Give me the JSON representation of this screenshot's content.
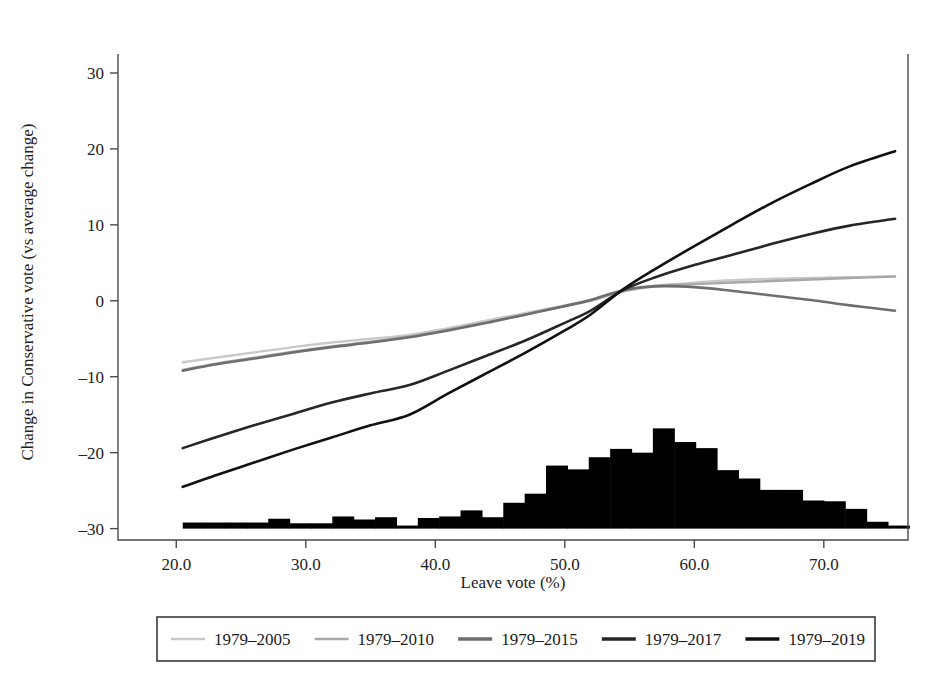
{
  "chart_data": {
    "type": "line",
    "title": "",
    "xlabel": "Leave vote (%)",
    "ylabel": "Change in Conservative vote (vs average change)",
    "xlim": [
      15.5,
      76.5
    ],
    "ylim": [
      -31.5,
      32.5
    ],
    "xticks": [
      20,
      30,
      40,
      50,
      60,
      70
    ],
    "xticklabels": [
      "20.0",
      "30.0",
      "40.0",
      "50.0",
      "60.0",
      "70.0"
    ],
    "yticks": [
      30,
      20,
      10,
      0,
      -10,
      -20,
      -30
    ],
    "yticklabels": [
      "30",
      "20",
      "10",
      "0",
      "–10",
      "–20",
      "–30"
    ],
    "grid": false,
    "legend_position": "below",
    "series": [
      {
        "name": "1979–2005",
        "color": "#c9c9c9",
        "width": 2.4,
        "x": [
          20.5,
          23,
          26,
          29,
          32,
          35,
          38,
          41,
          44,
          47,
          50,
          52,
          54.5,
          57,
          60,
          63,
          66,
          69,
          72,
          75.5
        ],
        "y": [
          -8.1,
          -7.5,
          -6.8,
          -6.1,
          -5.5,
          -5.0,
          -4.5,
          -3.6,
          -2.6,
          -1.6,
          -0.6,
          0.1,
          1.2,
          1.9,
          2.4,
          2.7,
          2.9,
          3.0,
          3.1,
          3.2
        ]
      },
      {
        "name": "1979–2010",
        "color": "#a8a8a8",
        "width": 2.4,
        "x": [
          20.5,
          23,
          26,
          29,
          32,
          35,
          38,
          41,
          44,
          47,
          50,
          52,
          54.5,
          57,
          60,
          63,
          66,
          69,
          72,
          75.5
        ],
        "y": [
          -9.1,
          -8.3,
          -7.5,
          -6.7,
          -6.0,
          -5.4,
          -4.7,
          -3.8,
          -2.8,
          -1.8,
          -0.7,
          0.0,
          1.3,
          2.0,
          2.2,
          2.4,
          2.6,
          2.8,
          3.0,
          3.2
        ]
      },
      {
        "name": "1979–2015",
        "color": "#6e6e6e",
        "width": 2.6,
        "x": [
          20.5,
          23,
          26,
          29,
          32,
          35,
          38,
          41,
          44,
          47,
          50,
          52,
          54.5,
          57,
          60,
          63,
          66,
          69,
          72,
          75.5
        ],
        "y": [
          -9.2,
          -8.4,
          -7.6,
          -6.8,
          -6.1,
          -5.5,
          -4.8,
          -3.9,
          -2.9,
          -1.8,
          -0.7,
          0.1,
          1.4,
          1.9,
          1.8,
          1.3,
          0.7,
          0.1,
          -0.6,
          -1.3
        ]
      },
      {
        "name": "1979–2017",
        "color": "#262626",
        "width": 2.6,
        "x": [
          20.5,
          23,
          26,
          29,
          32,
          35,
          38,
          41,
          44,
          47,
          50,
          52,
          54.5,
          57,
          60,
          63,
          66,
          69,
          72,
          75.5
        ],
        "y": [
          -19.4,
          -18.0,
          -16.4,
          -14.9,
          -13.4,
          -12.2,
          -11.1,
          -9.2,
          -7.2,
          -5.2,
          -2.9,
          -1.3,
          1.4,
          3.1,
          4.7,
          6.1,
          7.5,
          8.8,
          9.9,
          10.8
        ]
      },
      {
        "name": "1979–2019",
        "color": "#111111",
        "width": 2.6,
        "x": [
          20.5,
          23,
          26,
          29,
          32,
          35,
          38,
          41,
          44,
          47,
          50,
          52,
          54.5,
          57,
          60,
          63,
          66,
          69,
          72,
          75.5
        ],
        "y": [
          -24.5,
          -23.0,
          -21.3,
          -19.6,
          -18.0,
          -16.4,
          -15.0,
          -12.2,
          -9.5,
          -6.8,
          -3.9,
          -1.8,
          1.5,
          4.2,
          7.2,
          10.1,
          12.9,
          15.4,
          17.7,
          19.7
        ]
      }
    ],
    "histogram": {
      "name": "Distribution of seats by leave vote",
      "color": "#000000",
      "baseline": -30,
      "bin_width": 1.65,
      "bins_x": [
        20.5,
        22.15,
        23.8,
        25.45,
        27.1,
        28.75,
        30.4,
        32.05,
        33.7,
        35.35,
        37.0,
        38.65,
        40.3,
        41.95,
        43.6,
        45.25,
        46.9,
        48.55,
        50.2,
        51.85,
        53.5,
        55.15,
        56.8,
        58.45,
        60.1,
        61.75,
        63.4,
        65.05,
        66.7,
        68.35,
        70.0,
        71.65,
        73.3,
        74.95
      ],
      "bins_top": [
        -29.2,
        -29.2,
        -29.2,
        -29.2,
        -28.7,
        -29.3,
        -29.3,
        -28.4,
        -28.8,
        -28.5,
        -29.6,
        -28.6,
        -28.4,
        -27.6,
        -28.5,
        -26.6,
        -25.4,
        -21.7,
        -22.2,
        -20.6,
        -19.5,
        -20.0,
        -16.8,
        -18.6,
        -19.4,
        -22.3,
        -23.4,
        -24.9,
        -24.9,
        -26.3,
        -26.4,
        -27.4,
        -29.1,
        -29.6
      ]
    }
  },
  "legend": {
    "entries": [
      {
        "label": "1979–2005"
      },
      {
        "label": "1979–2010"
      },
      {
        "label": "1979–2015"
      },
      {
        "label": "1979–2017"
      },
      {
        "label": "1979–2019"
      }
    ]
  }
}
